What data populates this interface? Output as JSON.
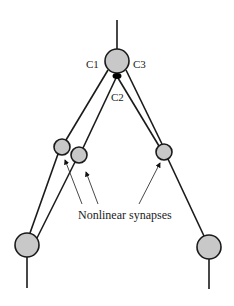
{
  "diagram": {
    "type": "neural-circuit",
    "colors": {
      "node_fill": "#c8c8c8",
      "line": "#1a1a1a",
      "synapse": "#000000",
      "background": "#ffffff"
    },
    "labels": {
      "c1": "C1",
      "c2": "C2",
      "c3": "C3",
      "caption": "Nonlinear synapses"
    },
    "nodes": [
      {
        "id": "top",
        "cx": 117,
        "cy": 61,
        "r": 12
      },
      {
        "id": "mid-left-1",
        "cx": 62,
        "cy": 147,
        "r": 8
      },
      {
        "id": "mid-left-2",
        "cx": 79,
        "cy": 155,
        "r": 8
      },
      {
        "id": "mid-right",
        "cx": 164,
        "cy": 152,
        "r": 8
      },
      {
        "id": "bottom-left",
        "cx": 27,
        "cy": 245,
        "r": 12
      },
      {
        "id": "bottom-right",
        "cx": 209,
        "cy": 247,
        "r": 12
      }
    ],
    "synapse": {
      "cx": 117,
      "cy": 76,
      "label": "black-synapse"
    }
  }
}
